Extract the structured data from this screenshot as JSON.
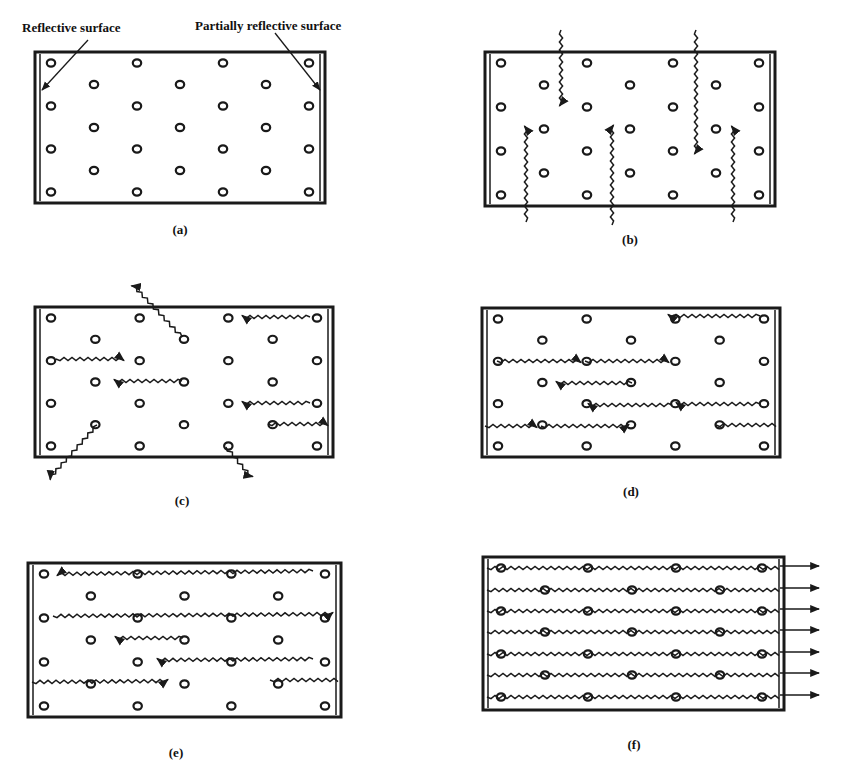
{
  "figure": {
    "annotations": {
      "reflective_surface": "Reflective surface",
      "partially_reflective_surface": "Partially reflective surface"
    },
    "panels": [
      {
        "id": "a",
        "caption": "(a)",
        "description": "Ground state: atoms in cavity between mirrors"
      },
      {
        "id": "b",
        "caption": "(b)",
        "description": "Pumping: photons absorbed, atoms excited"
      },
      {
        "id": "c",
        "caption": "(c)",
        "description": "Spontaneous emission in random directions"
      },
      {
        "id": "d",
        "caption": "(d)",
        "description": "Stimulated emission along cavity axis"
      },
      {
        "id": "e",
        "caption": "(e)",
        "description": "Amplification by reflection"
      },
      {
        "id": "f",
        "caption": "(f)",
        "description": "Coherent laser beam exits partially reflective surface"
      }
    ]
  },
  "colors": {
    "ink": "#1a1a1a",
    "background": "#ffffff"
  }
}
